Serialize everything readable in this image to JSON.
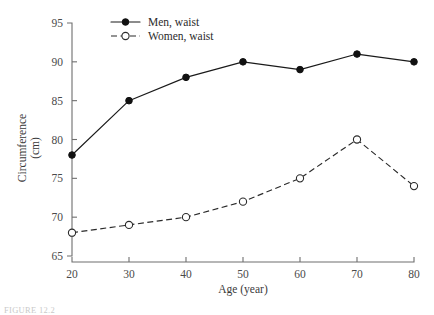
{
  "chart_data": {
    "type": "line",
    "title": "",
    "xlabel": "Age (year)",
    "ylabel": "Circumference",
    "ylabel_line2": "(cm)",
    "x": [
      20,
      30,
      40,
      50,
      60,
      70,
      80
    ],
    "xticks": [
      "20",
      "30",
      "40",
      "50",
      "60",
      "70",
      "80"
    ],
    "yticks": [
      "65",
      "70",
      "75",
      "80",
      "85",
      "90",
      "95"
    ],
    "xlim": [
      20,
      80
    ],
    "ylim": [
      65,
      95
    ],
    "grid": false,
    "legend_position": "top-center",
    "series": [
      {
        "name": "Men, waist",
        "values": [
          78,
          85,
          88,
          90,
          89,
          91,
          90
        ],
        "marker": "filled-circle",
        "linestyle": "solid",
        "color": "#111111"
      },
      {
        "name": "Women, waist",
        "values": [
          68,
          69,
          70,
          72,
          75,
          80,
          74
        ],
        "marker": "open-circle",
        "linestyle": "dashed",
        "color": "#2a2a2a"
      }
    ]
  },
  "legend": {
    "entries": [
      {
        "label": "Men, waist"
      },
      {
        "label": "Women, waist"
      }
    ]
  },
  "caption": {
    "text": "FIGURE 12.2"
  },
  "colors": {
    "axis": "#6e6e6e",
    "men": "#111111",
    "women": "#2a2a2a",
    "background": "#ffffff"
  }
}
